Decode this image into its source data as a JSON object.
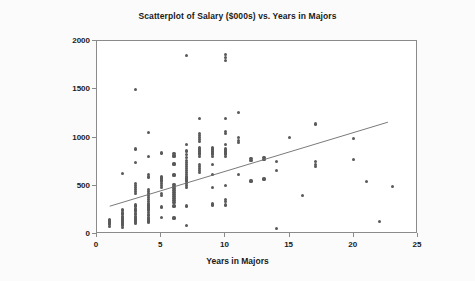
{
  "chart_data": {
    "type": "scatter",
    "title": "Scatterplot of Salary ($000s) vs. Years in Majors",
    "xlabel": "Years in Majors",
    "ylabel": "Salary ($000s)",
    "xlim": [
      0,
      25
    ],
    "ylim": [
      0,
      2000
    ],
    "xticks": [
      0,
      5,
      10,
      15,
      20,
      25
    ],
    "yticks": [
      0,
      500,
      1000,
      1500,
      2000
    ],
    "grid": false,
    "legend": null,
    "marker_color": "#595959",
    "line_color": "#6b6b6b",
    "frame_color": "#8a8a8a",
    "background_color": "#ffffff",
    "page_background_color": "#fbfbfb",
    "series": [
      {
        "name": "Players",
        "marker": "filled-circle",
        "points": [
          [
            1,
            75
          ],
          [
            1,
            100
          ],
          [
            1,
            110
          ],
          [
            1,
            120
          ],
          [
            1,
            130
          ],
          [
            1,
            140
          ],
          [
            1,
            150
          ],
          [
            2,
            70
          ],
          [
            2,
            85
          ],
          [
            2,
            100
          ],
          [
            2,
            110
          ],
          [
            2,
            120
          ],
          [
            2,
            130
          ],
          [
            2,
            140
          ],
          [
            2,
            150
          ],
          [
            2,
            160
          ],
          [
            2,
            175
          ],
          [
            2,
            185
          ],
          [
            2,
            200
          ],
          [
            2,
            215
          ],
          [
            2,
            225
          ],
          [
            2,
            240
          ],
          [
            2,
            250
          ],
          [
            2,
            630
          ],
          [
            3,
            110
          ],
          [
            3,
            120
          ],
          [
            3,
            130
          ],
          [
            3,
            140
          ],
          [
            3,
            155
          ],
          [
            3,
            170
          ],
          [
            3,
            185
          ],
          [
            3,
            200
          ],
          [
            3,
            215
          ],
          [
            3,
            230
          ],
          [
            3,
            245
          ],
          [
            3,
            260
          ],
          [
            3,
            290
          ],
          [
            3,
            300
          ],
          [
            3,
            420
          ],
          [
            3,
            440
          ],
          [
            3,
            460
          ],
          [
            3,
            480
          ],
          [
            3,
            500
          ],
          [
            3,
            520
          ],
          [
            3,
            740
          ],
          [
            3,
            880
          ],
          [
            3,
            1500
          ],
          [
            4,
            115
          ],
          [
            4,
            130
          ],
          [
            4,
            145
          ],
          [
            4,
            160
          ],
          [
            4,
            175
          ],
          [
            4,
            190
          ],
          [
            4,
            205
          ],
          [
            4,
            220
          ],
          [
            4,
            240
          ],
          [
            4,
            260
          ],
          [
            4,
            280
          ],
          [
            4,
            300
          ],
          [
            4,
            320
          ],
          [
            4,
            340
          ],
          [
            4,
            360
          ],
          [
            4,
            380
          ],
          [
            4,
            400
          ],
          [
            4,
            420
          ],
          [
            4,
            440
          ],
          [
            4,
            460
          ],
          [
            4,
            590
          ],
          [
            4,
            620
          ],
          [
            4,
            800
          ],
          [
            4,
            1050
          ],
          [
            5,
            170
          ],
          [
            5,
            280
          ],
          [
            5,
            400
          ],
          [
            5,
            420
          ],
          [
            5,
            480
          ],
          [
            5,
            500
          ],
          [
            5,
            520
          ],
          [
            5,
            540
          ],
          [
            5,
            560
          ],
          [
            5,
            580
          ],
          [
            5,
            600
          ],
          [
            5,
            840
          ],
          [
            6,
            165
          ],
          [
            6,
            290
          ],
          [
            6,
            330
          ],
          [
            6,
            350
          ],
          [
            6,
            370
          ],
          [
            6,
            390
          ],
          [
            6,
            410
          ],
          [
            6,
            430
          ],
          [
            6,
            450
          ],
          [
            6,
            470
          ],
          [
            6,
            490
          ],
          [
            6,
            510
          ],
          [
            6,
            610
          ],
          [
            6,
            620
          ],
          [
            6,
            720
          ],
          [
            6,
            730
          ],
          [
            6,
            800
          ],
          [
            6,
            815
          ],
          [
            6,
            830
          ],
          [
            7,
            90
          ],
          [
            7,
            290
          ],
          [
            7,
            480
          ],
          [
            7,
            500
          ],
          [
            7,
            520
          ],
          [
            7,
            540
          ],
          [
            7,
            560
          ],
          [
            7,
            580
          ],
          [
            7,
            600
          ],
          [
            7,
            620
          ],
          [
            7,
            640
          ],
          [
            7,
            660
          ],
          [
            7,
            680
          ],
          [
            7,
            700
          ],
          [
            7,
            720
          ],
          [
            7,
            740
          ],
          [
            7,
            760
          ],
          [
            7,
            790
          ],
          [
            7,
            820
          ],
          [
            7,
            860
          ],
          [
            7,
            930
          ],
          [
            7,
            1850
          ],
          [
            8,
            640
          ],
          [
            8,
            660
          ],
          [
            8,
            680
          ],
          [
            8,
            700
          ],
          [
            8,
            720
          ],
          [
            8,
            800
          ],
          [
            8,
            820
          ],
          [
            8,
            840
          ],
          [
            8,
            860
          ],
          [
            8,
            880
          ],
          [
            8,
            900
          ],
          [
            8,
            960
          ],
          [
            8,
            980
          ],
          [
            8,
            1000
          ],
          [
            8,
            1020
          ],
          [
            8,
            1040
          ],
          [
            8,
            1200
          ],
          [
            9,
            300
          ],
          [
            9,
            310
          ],
          [
            9,
            480
          ],
          [
            9,
            620
          ],
          [
            9,
            720
          ],
          [
            9,
            800
          ],
          [
            9,
            820
          ],
          [
            9,
            840
          ],
          [
            9,
            860
          ],
          [
            9,
            880
          ],
          [
            9,
            900
          ],
          [
            10,
            300
          ],
          [
            10,
            340
          ],
          [
            10,
            360
          ],
          [
            10,
            500
          ],
          [
            10,
            800
          ],
          [
            10,
            820
          ],
          [
            10,
            840
          ],
          [
            10,
            860
          ],
          [
            10,
            880
          ],
          [
            10,
            930
          ],
          [
            10,
            1040
          ],
          [
            10,
            1060
          ],
          [
            10,
            1200
          ],
          [
            10,
            1800
          ],
          [
            10,
            1830
          ],
          [
            10,
            1860
          ],
          [
            11,
            620
          ],
          [
            11,
            950
          ],
          [
            11,
            970
          ],
          [
            11,
            1000
          ],
          [
            11,
            1260
          ],
          [
            12,
            550
          ],
          [
            12,
            760
          ],
          [
            12,
            780
          ],
          [
            13,
            570
          ],
          [
            13,
            770
          ],
          [
            13,
            790
          ],
          [
            14,
            55
          ],
          [
            14,
            660
          ],
          [
            14,
            750
          ],
          [
            15,
            1000
          ],
          [
            16,
            400
          ],
          [
            17,
            700
          ],
          [
            17,
            720
          ],
          [
            17,
            750
          ],
          [
            17,
            1140
          ],
          [
            20,
            770
          ],
          [
            20,
            990
          ],
          [
            21,
            540
          ],
          [
            22,
            130
          ],
          [
            23,
            490
          ]
        ]
      }
    ],
    "trend_line": {
      "type": "linear-fit",
      "x_start": 1.0,
      "y_start": 270,
      "x_end": 22.8,
      "y_end": 1150
    }
  }
}
